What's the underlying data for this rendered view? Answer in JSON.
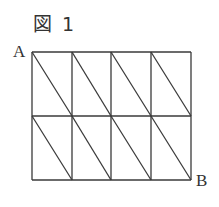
{
  "figure": {
    "title": "図 1",
    "points": {
      "A": "A",
      "B": "B"
    },
    "grid": {
      "columns": 4,
      "rows": 2,
      "x_lines": [
        32,
        72,
        111,
        151,
        191
      ],
      "y_lines": [
        52,
        116,
        180
      ],
      "diagonal_direction": "top-left to bottom-right in each cell"
    },
    "stroke_color": "#3a3a3a"
  }
}
